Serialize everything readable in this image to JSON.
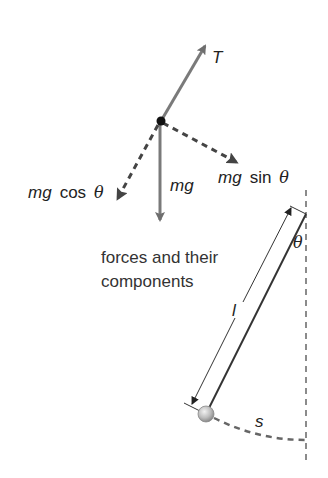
{
  "diagram": {
    "caption_line1": "forces and their",
    "caption_line2": "components",
    "labels": {
      "tension": "T",
      "weight": "mg",
      "tangential_prefix": "mg",
      "tangential_func": "sin",
      "tangential_theta": "θ",
      "radial_prefix": "mg",
      "radial_func": "cos",
      "radial_theta": "θ",
      "angle": "θ",
      "length": "l",
      "arc": "s"
    },
    "colors": {
      "force_arrow": "#7a7a7a",
      "dashed": "#555555",
      "string": "#333333",
      "dot": "#111111",
      "bob": "#bbbbbb"
    }
  }
}
